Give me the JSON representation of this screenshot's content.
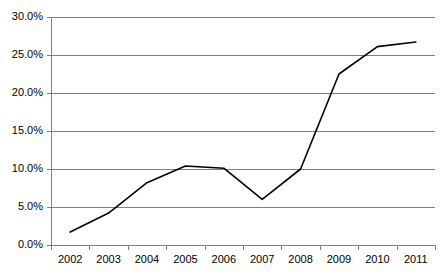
{
  "chart_data": {
    "type": "line",
    "title": "",
    "subtitle": "",
    "xlabel": "",
    "ylabel": "",
    "categories": [
      "2002",
      "2003",
      "2004",
      "2005",
      "2006",
      "2007",
      "2008",
      "2009",
      "2010",
      "2011"
    ],
    "values": [
      1.7,
      4.2,
      8.2,
      10.4,
      10.1,
      6.0,
      10.0,
      22.5,
      26.1,
      26.7
    ],
    "series": [
      {
        "name": "",
        "values": [
          1.7,
          4.2,
          8.2,
          10.4,
          10.1,
          6.0,
          10.0,
          22.5,
          26.1,
          26.7
        ]
      }
    ],
    "ylim": [
      0,
      30
    ],
    "ytick_values": [
      0,
      5,
      10,
      15,
      20,
      25,
      30
    ],
    "ytick_labels": [
      "0.0%",
      "5.0%",
      "10.0%",
      "15.0%",
      "20.0%",
      "25.0%",
      "30.0%"
    ],
    "xtick_labels": [
      "2002",
      "2003",
      "2004",
      "2005",
      "2006",
      "2007",
      "2008",
      "2009",
      "2010",
      "2011"
    ],
    "grid": true,
    "grid_axis": "y",
    "legend": false,
    "legend_position": "none",
    "annotations": [],
    "colors": {
      "line": "#000000",
      "grid": "#808080",
      "axis": "#808080",
      "background": "#ffffff",
      "text": "#000000"
    }
  },
  "layout": {
    "plot_left": 51,
    "plot_right": 435,
    "plot_top": 17,
    "plot_bottom": 245
  }
}
